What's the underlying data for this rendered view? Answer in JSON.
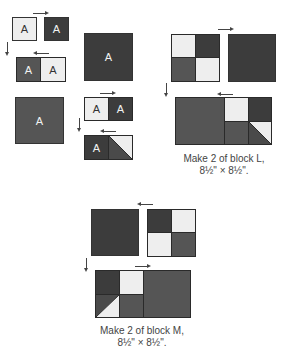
{
  "pieces": {
    "a_label": "A"
  },
  "captions": {
    "block_l": {
      "line1": "Make 2 of block L,",
      "line2": "8½\" × 8½\"."
    },
    "block_m": {
      "line1": "Make 2 of block M,",
      "line2": "8½\" × 8½\"."
    }
  },
  "colors": {
    "light": "#eeeeee",
    "medium": "#555555",
    "dark": "#3c3c3c",
    "border": "#2a2a2a"
  }
}
